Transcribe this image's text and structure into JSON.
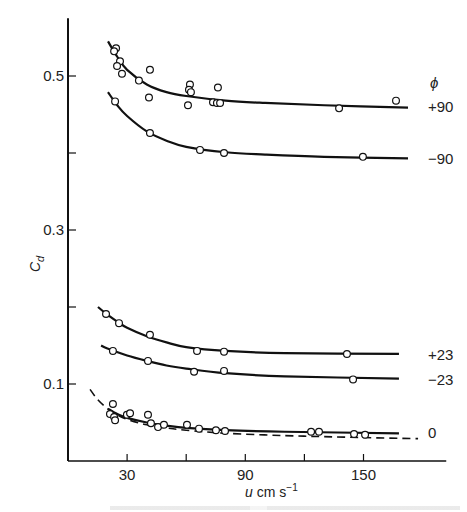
{
  "chart_data": {
    "type": "scatter",
    "title": "",
    "xlabel": "u cm s⁻¹",
    "xlabel_parts": {
      "var": "u",
      "unit": "cm s",
      "exp": "−1"
    },
    "ylabel": "Cd",
    "ylabel_parts": {
      "base": "C",
      "sub": "d"
    },
    "xlim": [
      0,
      190
    ],
    "ylim": [
      0,
      0.575
    ],
    "x_ticks": [
      30,
      60,
      90,
      120,
      150
    ],
    "x_tick_labels": [
      "30",
      "",
      "90",
      "",
      "150"
    ],
    "y_ticks": [
      0.1,
      0.2,
      0.3,
      0.4,
      0.5
    ],
    "y_tick_labels": [
      "0.1",
      "",
      "0.3",
      "",
      "0.5"
    ],
    "grid": false,
    "legend_title": "ϕ",
    "legend_position": "right, inline labels",
    "series": [
      {
        "name": "+90",
        "label": "+90",
        "label_y": 0.461,
        "points": [
          [
            24.4,
            0.536
          ],
          [
            23.4,
            0.532
          ],
          [
            26.4,
            0.519
          ],
          [
            24.9,
            0.513
          ],
          [
            27.4,
            0.503
          ],
          [
            36.0,
            0.494
          ],
          [
            41.6,
            0.508
          ],
          [
            41.1,
            0.472
          ],
          [
            61.9,
            0.489
          ],
          [
            61.4,
            0.482
          ],
          [
            62.4,
            0.479
          ],
          [
            60.9,
            0.462
          ],
          [
            76.1,
            0.485
          ],
          [
            73.6,
            0.466
          ],
          [
            75.6,
            0.465
          ],
          [
            77.2,
            0.465
          ],
          [
            137.6,
            0.458
          ],
          [
            166.5,
            0.468
          ]
        ],
        "fit": [
          [
            20.3,
            0.545
          ],
          [
            25,
            0.525
          ],
          [
            30,
            0.508
          ],
          [
            40,
            0.489
          ],
          [
            50,
            0.479
          ],
          [
            60,
            0.474
          ],
          [
            80,
            0.468
          ],
          [
            100,
            0.465
          ],
          [
            130,
            0.462
          ],
          [
            172.6,
            0.459
          ]
        ]
      },
      {
        "name": "-90",
        "label": "−90",
        "label_y": 0.394,
        "points": [
          [
            23.9,
            0.467
          ],
          [
            41.6,
            0.426
          ],
          [
            67.0,
            0.404
          ],
          [
            79.2,
            0.4
          ],
          [
            149.7,
            0.395
          ]
        ],
        "fit": [
          [
            20.3,
            0.479
          ],
          [
            25,
            0.462
          ],
          [
            30,
            0.448
          ],
          [
            40,
            0.428
          ],
          [
            50,
            0.416
          ],
          [
            60,
            0.408
          ],
          [
            80,
            0.401
          ],
          [
            100,
            0.398
          ],
          [
            130,
            0.395
          ],
          [
            172.6,
            0.393
          ]
        ]
      },
      {
        "name": "+23",
        "label": "+23",
        "label_y": 0.139,
        "points": [
          [
            19.3,
            0.191
          ],
          [
            25.9,
            0.179
          ],
          [
            41.6,
            0.164
          ],
          [
            65.5,
            0.143
          ],
          [
            79.2,
            0.142
          ],
          [
            141.6,
            0.139
          ]
        ],
        "fit": [
          [
            15.2,
            0.2
          ],
          [
            20,
            0.19
          ],
          [
            25,
            0.181
          ],
          [
            30,
            0.173
          ],
          [
            40,
            0.162
          ],
          [
            50,
            0.154
          ],
          [
            60,
            0.148
          ],
          [
            80,
            0.143
          ],
          [
            110,
            0.14
          ],
          [
            168,
            0.139
          ]
        ]
      },
      {
        "name": "-23",
        "label": "−23",
        "label_y": 0.107,
        "points": [
          [
            22.8,
            0.143
          ],
          [
            40.6,
            0.13
          ],
          [
            64.0,
            0.116
          ],
          [
            79.2,
            0.117
          ],
          [
            144.7,
            0.106
          ]
        ],
        "fit": [
          [
            16.8,
            0.15
          ],
          [
            20,
            0.146
          ],
          [
            30,
            0.137
          ],
          [
            40,
            0.13
          ],
          [
            50,
            0.124
          ],
          [
            60,
            0.12
          ],
          [
            80,
            0.114
          ],
          [
            110,
            0.11
          ],
          [
            168,
            0.107
          ]
        ]
      },
      {
        "name": "0",
        "label": "0",
        "label_y": 0.038,
        "points": [
          [
            22.8,
            0.074
          ],
          [
            21.3,
            0.061
          ],
          [
            23.4,
            0.057
          ],
          [
            23.9,
            0.053
          ],
          [
            29.9,
            0.06
          ],
          [
            31.5,
            0.062
          ],
          [
            40.6,
            0.06
          ],
          [
            42.1,
            0.049
          ],
          [
            45.7,
            0.044
          ],
          [
            48.7,
            0.047
          ],
          [
            60.4,
            0.047
          ],
          [
            66.5,
            0.042
          ],
          [
            75.1,
            0.04
          ],
          [
            79.7,
            0.039
          ],
          [
            123.4,
            0.038
          ],
          [
            127.4,
            0.038
          ],
          [
            145.2,
            0.035
          ],
          [
            150.8,
            0.034
          ]
        ],
        "fit": [
          [
            20.3,
            0.068
          ],
          [
            25,
            0.061
          ],
          [
            30,
            0.056
          ],
          [
            40,
            0.05
          ],
          [
            50,
            0.046
          ],
          [
            60,
            0.043
          ],
          [
            80,
            0.04
          ],
          [
            110,
            0.038
          ],
          [
            168,
            0.036
          ]
        ]
      },
      {
        "name": "0 (theory, dashed)",
        "label": "",
        "style": "dashed",
        "fit": [
          [
            11.2,
            0.093
          ],
          [
            15,
            0.08
          ],
          [
            20,
            0.068
          ],
          [
            25,
            0.06
          ],
          [
            30,
            0.054
          ],
          [
            40,
            0.047
          ],
          [
            50,
            0.043
          ],
          [
            60,
            0.04
          ],
          [
            80,
            0.036
          ],
          [
            110,
            0.033
          ],
          [
            140,
            0.031
          ],
          [
            177.7,
            0.029
          ]
        ]
      }
    ]
  }
}
